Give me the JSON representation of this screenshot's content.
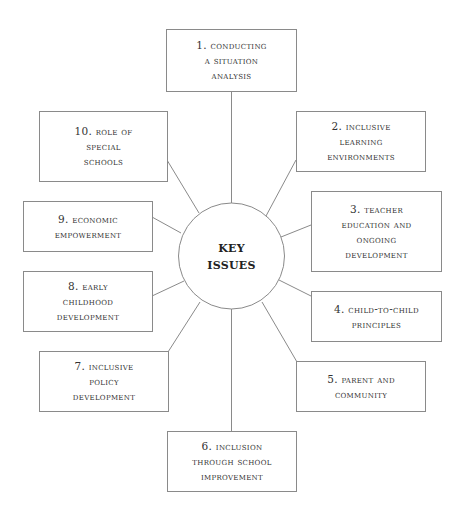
{
  "diagram": {
    "type": "hub-and-spoke",
    "colors": {
      "line": "#8a8a8a",
      "text": "#333333",
      "background": "#ffffff"
    },
    "hub": {
      "label_lines": [
        "KEY",
        "ISSUES"
      ]
    },
    "nodes": [
      {
        "id": 1,
        "label_lines": [
          "1. Conducting",
          "a situation",
          "analysis"
        ]
      },
      {
        "id": 2,
        "label_lines": [
          "2. Inclusive",
          "learning",
          "environments"
        ]
      },
      {
        "id": 3,
        "label_lines": [
          "3. Teacher",
          "education and",
          "ongoing",
          "development"
        ]
      },
      {
        "id": 4,
        "label_lines": [
          "4. Child-to-child",
          "principles"
        ]
      },
      {
        "id": 5,
        "label_lines": [
          "5. Parent and",
          "community"
        ]
      },
      {
        "id": 6,
        "label_lines": [
          "6. Inclusion",
          "through school",
          "improvement"
        ]
      },
      {
        "id": 7,
        "label_lines": [
          "7. Inclusive",
          "policy",
          "development"
        ]
      },
      {
        "id": 8,
        "label_lines": [
          "8. Early",
          "childhood",
          "development"
        ]
      },
      {
        "id": 9,
        "label_lines": [
          "9. Economic",
          "empowerment"
        ]
      },
      {
        "id": 10,
        "label_lines": [
          "10. Role of",
          "special",
          "schools"
        ]
      }
    ]
  }
}
